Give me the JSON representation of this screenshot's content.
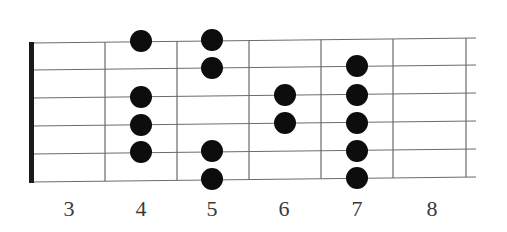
{
  "diagram": {
    "title": "",
    "type": "guitar-fretboard-scale-pattern",
    "colors": {
      "background": "#ffffff",
      "line": "#6b6b6b",
      "nut": "#1a1a1a",
      "dot": "#0d0d0d",
      "label": "#3a3a3a"
    },
    "nut_x": 32,
    "strings_y_left": [
      43,
      70,
      98,
      126,
      154,
      182
    ],
    "strings_y_right": [
      38,
      65,
      93,
      121,
      149,
      177
    ],
    "string_x_start": 32,
    "string_x_end": 476,
    "fret_lines_x": [
      105,
      177,
      249,
      321,
      393,
      466
    ],
    "fret_labels": [
      {
        "label": "3",
        "x": 69
      },
      {
        "label": "4",
        "x": 141
      },
      {
        "label": "5",
        "x": 212
      },
      {
        "label": "6",
        "x": 284
      },
      {
        "label": "7",
        "x": 357
      },
      {
        "label": "8",
        "x": 432
      }
    ],
    "dot_radius": 11,
    "dots": [
      {
        "fret": 4,
        "string": 1,
        "x": 141,
        "y": 41
      },
      {
        "fret": 4,
        "string": 3,
        "x": 141,
        "y": 97
      },
      {
        "fret": 4,
        "string": 4,
        "x": 141,
        "y": 125
      },
      {
        "fret": 4,
        "string": 5,
        "x": 141,
        "y": 152
      },
      {
        "fret": 5,
        "string": 1,
        "x": 212,
        "y": 40
      },
      {
        "fret": 5,
        "string": 2,
        "x": 212,
        "y": 68
      },
      {
        "fret": 5,
        "string": 5,
        "x": 212,
        "y": 151
      },
      {
        "fret": 5,
        "string": 6,
        "x": 212,
        "y": 179
      },
      {
        "fret": 6,
        "string": 3,
        "x": 285,
        "y": 95
      },
      {
        "fret": 6,
        "string": 4,
        "x": 285,
        "y": 123
      },
      {
        "fret": 7,
        "string": 2,
        "x": 357,
        "y": 66
      },
      {
        "fret": 7,
        "string": 3,
        "x": 357,
        "y": 95
      },
      {
        "fret": 7,
        "string": 4,
        "x": 357,
        "y": 123
      },
      {
        "fret": 7,
        "string": 5,
        "x": 357,
        "y": 151
      },
      {
        "fret": 7,
        "string": 6,
        "x": 357,
        "y": 178
      }
    ]
  }
}
